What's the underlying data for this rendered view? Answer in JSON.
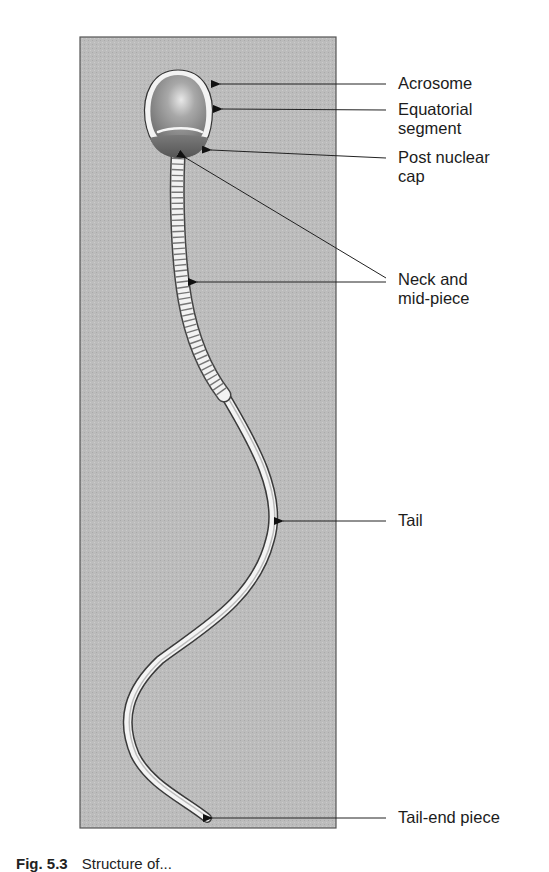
{
  "figure": {
    "panel_color": "#b9b9b9",
    "panel_border": "#5a5a5a",
    "labels": [
      {
        "id": "acrosome",
        "text": "Acrosome"
      },
      {
        "id": "equatorial-segment",
        "text": "Equatorial\nsegment"
      },
      {
        "id": "post-nuclear-cap",
        "text": "Post nuclear\ncap"
      },
      {
        "id": "neck-and-mid-piece",
        "text": "Neck and\nmid-piece"
      },
      {
        "id": "tail",
        "text": "Tail"
      },
      {
        "id": "tail-end-piece",
        "text": "Tail-end piece"
      }
    ],
    "caption": {
      "number": "Fig. 5.3",
      "text": "Structure of..."
    }
  }
}
